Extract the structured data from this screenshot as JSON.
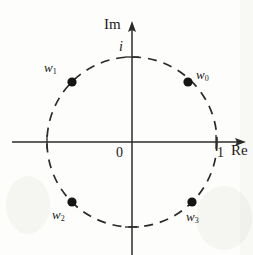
{
  "figure": {
    "background_color": "#fdfdfb",
    "ink_color": "#1a1a1a"
  },
  "axes": {
    "imaginary_axis_label": "Im",
    "real_axis_label": "Re",
    "origin_label": "0",
    "imaginary_unit_label": "i",
    "real_unit_label": "1",
    "origin_px": {
      "x": 132,
      "y": 142
    },
    "horizontal_extent_px": {
      "start_x": 12,
      "end_x": 246
    },
    "vertical_extent_px": {
      "top_y": 22,
      "bottom_y": 255
    },
    "arrow_directions": [
      "right",
      "up"
    ]
  },
  "unit_circle": {
    "style": "dashed",
    "radius_px": 85,
    "center_px": {
      "x": 132,
      "y": 142
    },
    "stroke_color": "#2a2a2a",
    "dash_pattern": "9 7"
  },
  "chart_data": {
    "type": "scatter",
    "xlabel": "Re",
    "ylabel": "Im",
    "xlim": [
      -1.42,
      1.35
    ],
    "ylim": [
      -1.33,
      1.42
    ],
    "grid": false,
    "legend": "none",
    "curves": [
      {
        "name": "unit circle",
        "shape": "circle",
        "center": [
          0,
          0
        ],
        "radius": 1,
        "linestyle": "dashed"
      }
    ],
    "annotations": [
      {
        "text": "Im",
        "x": 0,
        "y": 1.47,
        "role": "axis-label"
      },
      {
        "text": "Re",
        "x": 1.17,
        "y": -0.04,
        "role": "axis-label"
      },
      {
        "text": "i",
        "x": -0.1,
        "y": 1.0,
        "role": "tick-label"
      },
      {
        "text": "1",
        "x": 1.02,
        "y": -0.11,
        "role": "tick-label"
      },
      {
        "text": "0",
        "x": -0.1,
        "y": -0.1,
        "role": "origin-label"
      }
    ],
    "points": [
      {
        "label": "w0",
        "angle_deg": 45,
        "x": 0.7071,
        "y": 0.7071,
        "px": {
          "x": 188,
          "y": 82
        },
        "label_px": {
          "x": 196,
          "y": 68
        }
      },
      {
        "label": "w1",
        "angle_deg": 135,
        "x": -0.7071,
        "y": 0.7071,
        "px": {
          "x": 72,
          "y": 82
        },
        "label_px": {
          "x": 44,
          "y": 61
        }
      },
      {
        "label": "w2",
        "angle_deg": 225,
        "x": -0.7071,
        "y": -0.7071,
        "px": {
          "x": 72,
          "y": 202
        },
        "label_px": {
          "x": 52,
          "y": 208
        }
      },
      {
        "label": "w3",
        "angle_deg": 315,
        "x": 0.7071,
        "y": -0.7071,
        "px": {
          "x": 192,
          "y": 202
        },
        "label_px": {
          "x": 186,
          "y": 210
        }
      }
    ]
  },
  "point_labels": {
    "w0": {
      "base": "w",
      "sub": "0"
    },
    "w1": {
      "base": "w",
      "sub": "1"
    },
    "w2": {
      "base": "w",
      "sub": "2"
    },
    "w3": {
      "base": "w",
      "sub": "3"
    }
  }
}
